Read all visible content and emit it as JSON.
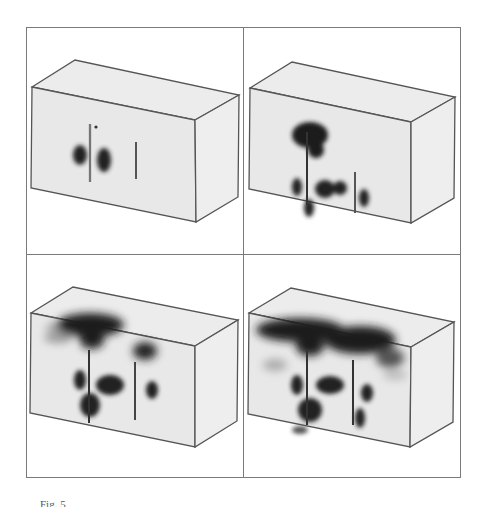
{
  "figure": {
    "caption": "Fig. 5",
    "panel_count": 4,
    "colors": {
      "frame": "#7a7a7a",
      "box_edge": "#555555",
      "box_fill": "#e9e9e9",
      "box_top_fill": "#ececec",
      "box_side_fill": "#efefef",
      "plume": "#1f1f1f"
    },
    "panels": [
      {
        "id": "a",
        "position": "top-left",
        "label": "stage-1",
        "description": "Two wells in box, small dark regions around left well"
      },
      {
        "id": "b",
        "position": "top-right",
        "label": "stage-2",
        "description": "Dark plume at top of left well, spreading regions between wells"
      },
      {
        "id": "c",
        "position": "bottom-left",
        "label": "stage-3",
        "description": "Plume spreading along top surface from left well, plume starting at right well"
      },
      {
        "id": "d",
        "position": "bottom-right",
        "label": "stage-4",
        "description": "Large plume covering top surface from both wells"
      }
    ]
  }
}
